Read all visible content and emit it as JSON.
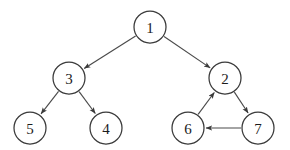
{
  "figure": {
    "kind": "directed-graph-diagram",
    "background_color": "#ffffff",
    "node_stroke_color": "#3a3a3a",
    "edge_stroke_color": "#4a4a4a",
    "label_color": "#1c1c1c",
    "node_radius": 16
  },
  "nodes": [
    {
      "id": "1",
      "label": "1",
      "cx": 150,
      "cy": 27
    },
    {
      "id": "2",
      "label": "2",
      "cx": 225,
      "cy": 78
    },
    {
      "id": "3",
      "label": "3",
      "cx": 69,
      "cy": 78
    },
    {
      "id": "4",
      "label": "4",
      "cx": 106,
      "cy": 128
    },
    {
      "id": "5",
      "label": "5",
      "cx": 30,
      "cy": 128
    },
    {
      "id": "6",
      "label": "6",
      "cx": 188,
      "cy": 128
    },
    {
      "id": "7",
      "label": "7",
      "cx": 258,
      "cy": 128
    }
  ],
  "edges": [
    {
      "id": "edge-1-3",
      "from": "1",
      "to": "3",
      "directed": true
    },
    {
      "id": "edge-1-2",
      "from": "1",
      "to": "2",
      "directed": true
    },
    {
      "id": "edge-3-5",
      "from": "3",
      "to": "5",
      "directed": true
    },
    {
      "id": "edge-3-4",
      "from": "3",
      "to": "4",
      "directed": true
    },
    {
      "id": "edge-2-7",
      "from": "2",
      "to": "7",
      "directed": true
    },
    {
      "id": "edge-7-6",
      "from": "7",
      "to": "6",
      "directed": true
    },
    {
      "id": "edge-6-2",
      "from": "6",
      "to": "2",
      "directed": true
    }
  ]
}
